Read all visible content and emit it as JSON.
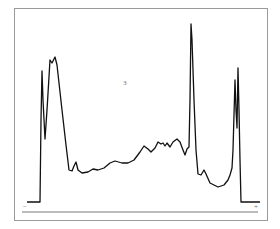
{
  "chart_data": {
    "type": "line",
    "title": "",
    "panel_label": "3",
    "xlabel": "",
    "ylabel": "",
    "axis_markers": {
      "left": "−",
      "right": "+"
    },
    "grid": false,
    "legend": null,
    "points": [
      [
        27,
        202
      ],
      [
        40,
        202
      ],
      [
        41,
        120
      ],
      [
        42,
        71
      ],
      [
        43,
        100
      ],
      [
        45,
        139
      ],
      [
        47,
        110
      ],
      [
        50,
        60
      ],
      [
        52,
        63
      ],
      [
        55,
        57
      ],
      [
        57,
        65
      ],
      [
        62,
        110
      ],
      [
        66,
        145
      ],
      [
        69,
        170
      ],
      [
        72,
        171
      ],
      [
        74,
        166
      ],
      [
        76,
        162
      ],
      [
        78,
        170
      ],
      [
        82,
        173
      ],
      [
        88,
        172
      ],
      [
        93,
        169
      ],
      [
        98,
        170
      ],
      [
        104,
        168
      ],
      [
        110,
        163
      ],
      [
        115,
        161
      ],
      [
        122,
        163
      ],
      [
        128,
        163
      ],
      [
        134,
        160
      ],
      [
        140,
        152
      ],
      [
        144,
        146
      ],
      [
        148,
        149
      ],
      [
        151,
        152
      ],
      [
        155,
        148
      ],
      [
        158,
        142
      ],
      [
        161,
        144
      ],
      [
        163,
        143
      ],
      [
        165,
        146
      ],
      [
        167,
        143
      ],
      [
        170,
        147
      ],
      [
        173,
        142
      ],
      [
        177,
        139
      ],
      [
        180,
        142
      ],
      [
        183,
        150
      ],
      [
        185,
        155
      ],
      [
        187,
        149
      ],
      [
        189,
        147
      ],
      [
        190,
        100
      ],
      [
        191,
        24
      ],
      [
        192,
        40
      ],
      [
        194,
        100
      ],
      [
        196,
        150
      ],
      [
        198,
        174
      ],
      [
        201,
        175
      ],
      [
        204,
        170
      ],
      [
        206,
        174
      ],
      [
        210,
        183
      ],
      [
        218,
        187
      ],
      [
        224,
        185
      ],
      [
        228,
        180
      ],
      [
        230,
        175
      ],
      [
        232,
        168
      ],
      [
        233,
        150
      ],
      [
        235,
        80
      ],
      [
        236,
        110
      ],
      [
        237,
        128
      ],
      [
        238,
        68
      ],
      [
        239,
        110
      ],
      [
        240,
        160
      ],
      [
        241,
        202
      ],
      [
        260,
        202
      ]
    ],
    "axis_line": {
      "x1": 22,
      "x2": 258,
      "y": 212
    }
  },
  "colors": {
    "trace": "#111111",
    "frame": "#9a9a9a",
    "axis": "#555555"
  }
}
